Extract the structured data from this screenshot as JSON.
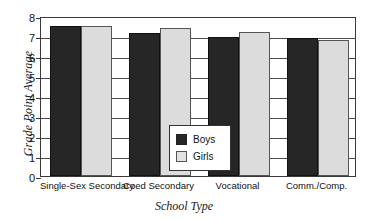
{
  "chart_data": {
    "type": "bar",
    "title": "",
    "xlabel": "School Type",
    "ylabel": "Grade Point Average",
    "categories": [
      "Single-Sex Secondary",
      "Coed Secondary",
      "Vocational",
      "Comm./Comp."
    ],
    "series": [
      {
        "name": "Boys",
        "color": "#262626",
        "values": [
          7.5,
          7.15,
          6.95,
          6.9
        ]
      },
      {
        "name": "Girls",
        "color": "#dcdcdc",
        "values": [
          7.5,
          7.4,
          7.2,
          6.8
        ]
      }
    ],
    "ylim": [
      0,
      8
    ],
    "yticks": [
      0,
      1,
      2,
      3,
      4,
      5,
      6,
      7,
      8
    ],
    "ytick_labels": [
      "0",
      "1",
      "2",
      "3",
      "4",
      "5",
      "6",
      "7",
      "8"
    ],
    "grid": true,
    "grid_axis": "y",
    "legend_position": "center"
  },
  "legend": {
    "entries": [
      {
        "label": "Boys"
      },
      {
        "label": "Girls"
      }
    ]
  }
}
